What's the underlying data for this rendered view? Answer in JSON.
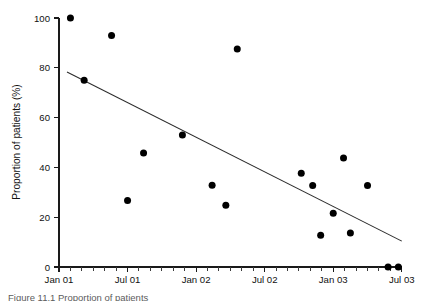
{
  "chart_data": {
    "type": "scatter",
    "title": "",
    "xlabel": "",
    "ylabel": "Proportion of patients (%)",
    "ylim": [
      0,
      100
    ],
    "xlim": [
      "Jan 01",
      "Jul 03"
    ],
    "grid": false,
    "legend": "none",
    "y_ticks": [
      0,
      20,
      40,
      60,
      80,
      100
    ],
    "y_tick_labels": [
      "0",
      "20",
      "40",
      "60",
      "80",
      "100"
    ],
    "x_ticks": [
      0,
      6,
      12,
      18,
      24,
      30
    ],
    "x_tick_labels": [
      "Jan 01",
      "Jul 01",
      "Jan 02",
      "Jul 02",
      "Jan 03",
      "Jul 03"
    ],
    "x_minor_tick_interval_months": 1,
    "x_unit": "months since Jan 01",
    "series": [
      {
        "name": "Proportion of patients",
        "marker": "filled-circle",
        "color": "#000000",
        "points": [
          {
            "x": 1.0,
            "y": 100.0,
            "x_label": "Feb 01"
          },
          {
            "x": 2.2,
            "y": 75.0,
            "x_label": "Mar 01"
          },
          {
            "x": 4.6,
            "y": 93.0,
            "x_label": "May 01"
          },
          {
            "x": 6.0,
            "y": 26.7,
            "x_label": "Jul 01"
          },
          {
            "x": 7.4,
            "y": 45.8,
            "x_label": "Aug 01"
          },
          {
            "x": 10.8,
            "y": 53.0,
            "x_label": "Nov 01"
          },
          {
            "x": 13.4,
            "y": 32.8,
            "x_label": "Feb 02"
          },
          {
            "x": 14.6,
            "y": 24.8,
            "x_label": "Mar 02"
          },
          {
            "x": 15.6,
            "y": 87.6,
            "x_label": "Apr 02"
          },
          {
            "x": 21.2,
            "y": 37.7,
            "x_label": "Oct 02"
          },
          {
            "x": 22.2,
            "y": 32.7,
            "x_label": "Nov 02"
          },
          {
            "x": 22.9,
            "y": 12.8,
            "x_label": "Dec 02"
          },
          {
            "x": 24.0,
            "y": 21.6,
            "x_label": "Jan 03"
          },
          {
            "x": 24.9,
            "y": 43.8,
            "x_label": "Feb 03"
          },
          {
            "x": 25.5,
            "y": 13.7,
            "x_label": "Feb 03"
          },
          {
            "x": 27.0,
            "y": 32.7,
            "x_label": "Apr 03"
          },
          {
            "x": 28.8,
            "y": 0.0,
            "x_label": "Jun 03"
          },
          {
            "x": 29.7,
            "y": 0.0,
            "x_label": "Jun 03"
          }
        ]
      }
    ],
    "trend_line": {
      "name": "linear regression",
      "color": "#2b2b2b",
      "x_start": 0.7,
      "y_start": 78.3,
      "x_end": 30.0,
      "y_end": 10.4
    }
  },
  "caption": {
    "text": "Figure 11.1 Proportion of patients"
  }
}
